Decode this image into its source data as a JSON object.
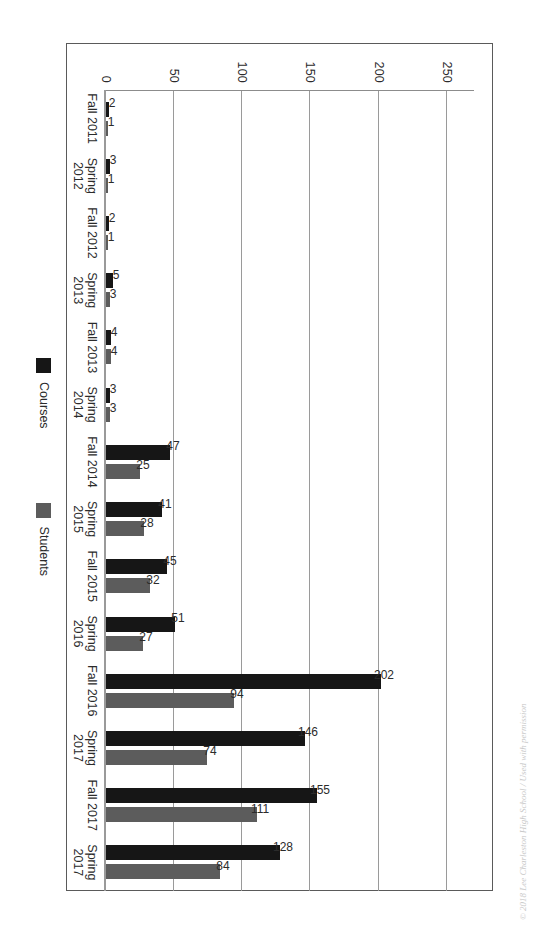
{
  "chart_data": {
    "type": "bar",
    "orientation": "vertical-rendered-rotated-90",
    "title": "",
    "subtitle": "",
    "xlabel": "",
    "ylabel": "",
    "ylim": [
      0,
      270
    ],
    "grid": true,
    "legend_position": "bottom",
    "tick_labels": [
      "0",
      "50",
      "100",
      "150",
      "200",
      "250"
    ],
    "tick_values": [
      0,
      50,
      100,
      150,
      200,
      250
    ],
    "categories": [
      "Fall 2011",
      "Spring\n2012",
      "Fall 2012",
      "Spring\n2013",
      "Fall 2013",
      "Spring\n2014",
      "Fall 2014",
      "Spring\n2015",
      "Fall 2015",
      "Spring\n2016",
      "Fall 2016",
      "Spring\n2017",
      "Fall 2017",
      "Spring\n2017"
    ],
    "series": [
      {
        "name": "Courses",
        "color": "#161616",
        "values": [
          2,
          3,
          2,
          5,
          4,
          3,
          47,
          41,
          45,
          51,
          202,
          146,
          155,
          128
        ]
      },
      {
        "name": "Students",
        "color": "#5c5c5c",
        "values": [
          1,
          1,
          1,
          3,
          4,
          3,
          25,
          28,
          32,
          27,
          94,
          74,
          111,
          84
        ]
      }
    ]
  },
  "legend": {
    "items": [
      {
        "label": "Courses",
        "color": "#161616"
      },
      {
        "label": "Students",
        "color": "#5c5c5c"
      }
    ]
  },
  "footnote": {
    "text": "© 2018 Lee Charleston High School / Used with permission"
  }
}
